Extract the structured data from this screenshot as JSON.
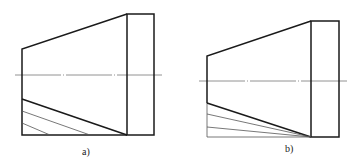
{
  "figures": [
    {
      "id": "a",
      "label": "a)",
      "description": "Truncated cone with cylinder end; parallel development lines",
      "rect": {
        "x1": 127,
        "y1": 14,
        "x2": 154,
        "y2": 135
      },
      "cone": {
        "left_x": 22,
        "top_y": 49,
        "bottom_y": 99
      },
      "centerline": {
        "x1": 15,
        "x2": 162,
        "y": 75
      },
      "auxiliary_lines": [
        {
          "x1": 22,
          "y1": 111,
          "x2": 90,
          "y2": 135
        },
        {
          "x1": 22,
          "y1": 123,
          "x2": 50,
          "y2": 135
        }
      ],
      "label_pos": {
        "x": 82,
        "y": 155
      }
    },
    {
      "id": "b",
      "label": "b)",
      "description": "Truncated cone with cylinder end; radial development lines converging to corner",
      "rect": {
        "x1": 311,
        "y1": 21,
        "x2": 339,
        "y2": 137
      },
      "cone": {
        "left_x": 207,
        "top_y": 56,
        "bottom_y": 103
      },
      "centerline": {
        "x1": 199,
        "x2": 347,
        "y": 81
      },
      "auxiliary_lines": [
        {
          "x1": 207,
          "y1": 114,
          "x2": 311,
          "y2": 137
        },
        {
          "x1": 207,
          "y1": 127,
          "x2": 311,
          "y2": 137
        }
      ],
      "label_pos": {
        "x": 285,
        "y": 152
      }
    }
  ],
  "colors": {
    "outline": "#1a1a1a",
    "thin": "#555555",
    "centerline": "#777777",
    "background": "#ffffff"
  }
}
